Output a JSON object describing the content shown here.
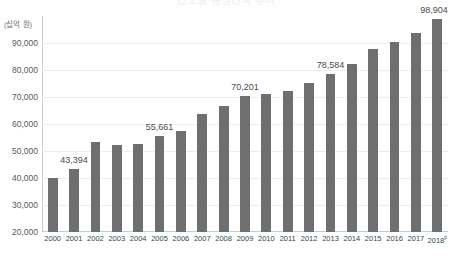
{
  "chart_data": {
    "type": "bar",
    "title": "연도별 총생산액 추이",
    "xlabel": "",
    "ylabel": "(십억 원)",
    "y_unit_caption": "(십억 원)",
    "ylim": [
      20000,
      100000
    ],
    "yticks": [
      "90,000",
      "80,000",
      "70,000",
      "60,000",
      "50,000",
      "40,000",
      "30,000",
      "20,000"
    ],
    "ytick_values": [
      90000,
      80000,
      70000,
      60000,
      50000,
      40000,
      30000,
      20000
    ],
    "grid": true,
    "legend": "none",
    "bar_color": "#6e6f71",
    "axis_color": "#c9cbcd",
    "gridline_color": "#ededef",
    "xtick_color": "#2c4a52",
    "categories": [
      "2000",
      "2001",
      "2002",
      "2003",
      "2004",
      "2005",
      "2006",
      "2007",
      "2008",
      "2009",
      "2010",
      "2011",
      "2012",
      "2013",
      "2014",
      "2015",
      "2016",
      "2017",
      "2018"
    ],
    "last_category_superscript": "p",
    "values": [
      40000,
      43394,
      53200,
      52400,
      52500,
      55661,
      57400,
      63800,
      66700,
      70201,
      71300,
      72400,
      75300,
      78584,
      82300,
      87900,
      90400,
      93700,
      98904
    ],
    "labeled_points": [
      {
        "category": "2001",
        "label": "43,394"
      },
      {
        "category": "2005",
        "label": "55,661"
      },
      {
        "category": "2009",
        "label": "70,201"
      },
      {
        "category": "2013",
        "label": "78,584"
      },
      {
        "category": "2018",
        "label": "98,904"
      }
    ]
  }
}
